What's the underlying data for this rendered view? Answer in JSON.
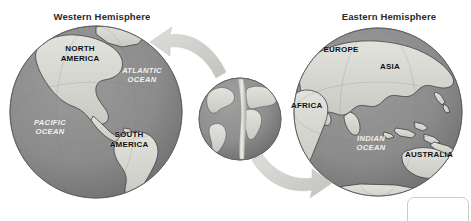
{
  "figure": {
    "name": "hemispheres-diagram",
    "background_color": "#ffffff",
    "ocean_color": "#8c8c8c",
    "land_color": "#d7d8d2",
    "outline_color": "#3a3a3a",
    "arrow_color": "#d0d0cc",
    "title_color": "#2b2b2b",
    "land_label_color": "#101010",
    "ocean_label_color": "#f2f2ef"
  },
  "titles": {
    "west": "Western Hemisphere",
    "east": "Eastern Hemisphere"
  },
  "globes": {
    "west": {
      "name": "western-hemisphere-globe",
      "cx": 96,
      "cy": 112,
      "r": 86
    },
    "center": {
      "name": "center-globe",
      "cx": 240,
      "cy": 119,
      "r": 41,
      "split_line": true
    },
    "east": {
      "name": "eastern-hemisphere-globe",
      "cx": 378,
      "cy": 112,
      "r": 84
    }
  },
  "labels": {
    "west": {
      "north_america": "NORTH\nAMERICA",
      "south_america": "SOUTH\nAMERICA",
      "atlantic_ocean": "ATLANTIC\nOCEAN",
      "pacific_ocean": "PACIFIC\nOCEAN"
    },
    "east": {
      "europe": "EUROPE",
      "asia": "ASIA",
      "africa": "AFRICA",
      "australia": "AUSTRALIA",
      "indian_ocean": "INDIAN\nOCEAN"
    }
  },
  "arrows": {
    "left": {
      "name": "arrow-to-western-hemisphere",
      "direction": "up-left",
      "from": "center-globe",
      "to": "western-hemisphere-globe"
    },
    "right": {
      "name": "arrow-to-eastern-hemisphere",
      "direction": "down-right",
      "from": "center-globe",
      "to": "eastern-hemisphere-globe"
    }
  },
  "corner_decoration": {
    "name": "corner-rounded-box",
    "visible": true
  }
}
